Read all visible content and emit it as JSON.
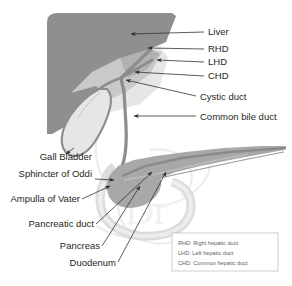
{
  "figure": {
    "background_color": "#ffffff"
  },
  "colors": {
    "liver_dark": "#8f8f90",
    "liver_light": "#c9c9cb",
    "liver_pale": "#e3e3e5",
    "duct": "#8d8d8f",
    "duct_outline": "#6f6f72",
    "gallbladder_fill": "#e6e6e8",
    "pancreas": "#a8a8aa",
    "pancreas_dark": "#8a8a8c",
    "duodenum": "#d8d8da",
    "leader_line": "#333336",
    "label_text": "#231f20",
    "legend_text": "#5d5d62",
    "legend_border": "#b9b9bd",
    "watermark": "#f0f0f2"
  },
  "labels_right": [
    {
      "id": "liver",
      "text": "Liver"
    },
    {
      "id": "rhd",
      "text": "RHD"
    },
    {
      "id": "lhd",
      "text": "LHD"
    },
    {
      "id": "chd",
      "text": "CHD"
    },
    {
      "id": "cystic-duct",
      "text": "Cystic duct"
    },
    {
      "id": "common-bile-duct",
      "text": "Common bile duct"
    }
  ],
  "labels_left": [
    {
      "id": "gall-bladder",
      "text": "Gall Bladder"
    },
    {
      "id": "sphincter-of-oddi",
      "text": "Sphincter of Oddi"
    },
    {
      "id": "ampulla-of-vater",
      "text": "Ampulla of Vater"
    },
    {
      "id": "pancreatic-duct",
      "text": "Pancreatic duct"
    },
    {
      "id": "pancreas",
      "text": "Pancreas"
    },
    {
      "id": "duodenum",
      "text": "Duodenum"
    }
  ],
  "legend": {
    "entries": [
      {
        "abbr": "RHD:",
        "text": "RHD: Right hepatic duct"
      },
      {
        "abbr": "LHD:",
        "text": "LHD: Left hepatic duct"
      },
      {
        "abbr": "CHD:",
        "text": "CHD: Common hepatic duct"
      }
    ]
  },
  "watermark": {
    "text": "Dr"
  },
  "structures": [
    {
      "id": "liver",
      "name": "liver"
    },
    {
      "id": "gallbladder",
      "name": "gallbladder"
    },
    {
      "id": "biliary-tree",
      "name": "biliary-tree"
    },
    {
      "id": "pancreas",
      "name": "pancreas"
    },
    {
      "id": "duodenum",
      "name": "duodenum"
    }
  ]
}
